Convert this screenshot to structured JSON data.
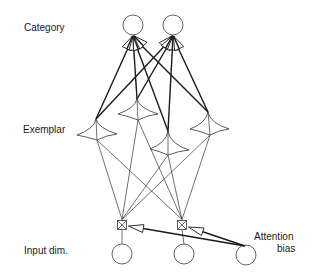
{
  "diagram": {
    "type": "network-architecture",
    "labels": {
      "category": "Category",
      "exemplar": "Exemplar",
      "input": "Input dim.",
      "attention_line1": "Attention",
      "attention_line2": "bias"
    },
    "layers": {
      "category_nodes": [
        {
          "id": "cat-1",
          "cx": 133,
          "cy": 25,
          "r": 10
        },
        {
          "id": "cat-2",
          "cx": 173,
          "cy": 25,
          "r": 10
        }
      ],
      "exemplar_nodes": [
        {
          "id": "ex-1",
          "apex": [
            96,
            119
          ],
          "left": [
            77,
            135
          ],
          "right": [
            117,
            134
          ],
          "bottom": [
            97,
            140
          ]
        },
        {
          "id": "ex-2",
          "apex": [
            137,
            99
          ],
          "left": [
            118,
            114
          ],
          "right": [
            158,
            114
          ],
          "bottom": [
            138,
            120
          ]
        },
        {
          "id": "ex-3",
          "apex": [
            168,
            131
          ],
          "left": [
            150,
            149
          ],
          "right": [
            189,
            150
          ],
          "bottom": [
            168,
            155
          ]
        },
        {
          "id": "ex-4",
          "apex": [
            208,
            112
          ],
          "left": [
            190,
            129
          ],
          "right": [
            229,
            129
          ],
          "bottom": [
            210,
            135
          ]
        }
      ],
      "attention_gates": [
        {
          "id": "gate-1",
          "cx": 122,
          "cy": 225,
          "size": 9
        },
        {
          "id": "gate-2",
          "cx": 182,
          "cy": 225,
          "size": 9
        }
      ],
      "input_nodes": [
        {
          "id": "in-1",
          "cx": 122,
          "cy": 254,
          "r": 10
        },
        {
          "id": "in-2",
          "cx": 184,
          "cy": 254,
          "r": 10
        },
        {
          "id": "in-3",
          "cx": 246,
          "cy": 255,
          "r": 10
        }
      ]
    },
    "connections": {
      "category_to_exemplar": "all-to-all (thick, with arrowhead fans at category nodes)",
      "exemplar_to_gate": "all-to-all (thin)",
      "gate_to_input": "one-to-one (thin)",
      "attention_bias_arrows": [
        "in-3 -> gate-1",
        "in-3 -> gate-2"
      ]
    }
  }
}
